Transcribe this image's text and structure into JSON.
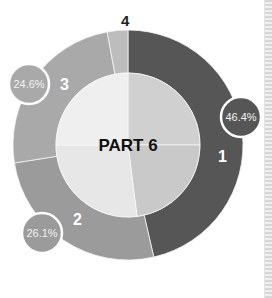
{
  "chart_data": {
    "type": "pie",
    "subtype": "donut",
    "title": "PART 6",
    "categories": [
      "1",
      "2",
      "3",
      "4"
    ],
    "values": [
      46.4,
      26.1,
      24.6,
      2.9
    ],
    "value_labels": [
      "46.4%",
      "26.1%",
      "24.6%",
      ""
    ],
    "segment_labels": [
      "1",
      "2",
      "3",
      "4"
    ],
    "colors": [
      "#565656",
      "#9b9b9b",
      "#a9a9a9",
      "#bdbdbd"
    ],
    "inner_quadrant_colors": [
      "#d0d0d0",
      "#c9c9c9",
      "#e7e7e7",
      "#efefef"
    ],
    "legend": "none",
    "start_angle": "top, clockwise"
  },
  "center_label": "PART 6",
  "bubbles": [
    {
      "text": "46.4%",
      "segment": "1"
    },
    {
      "text": "26.1%",
      "segment": "2"
    },
    {
      "text": "24.6%",
      "segment": "3"
    }
  ],
  "segment_numbers": [
    "1",
    "2",
    "3",
    "4"
  ]
}
